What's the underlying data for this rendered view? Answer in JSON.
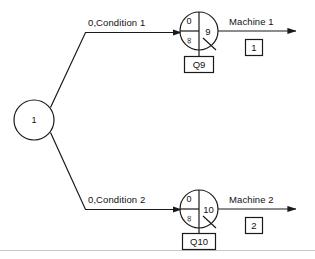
{
  "diagram": {
    "type": "queueing-network-flow-diagram",
    "source_node": {
      "label": "1",
      "name": "source-node"
    },
    "branches": [
      {
        "id": "branch-1",
        "edge_label": "0,Condition 1",
        "queue_node": {
          "top_left": "0",
          "bottom_left": "∞",
          "right": "9",
          "queue_label": "Q9"
        },
        "service_label": "Machine 1",
        "service_box": "1"
      },
      {
        "id": "branch-2",
        "edge_label": "0,Condition 2",
        "queue_node": {
          "top_left": "0",
          "bottom_left": "∞",
          "right": "10",
          "queue_label": "Q10"
        },
        "service_label": "Machine 2",
        "service_box": "2"
      }
    ],
    "colors": {
      "ink": "#1a1a1a",
      "paper": "#ffffff",
      "rule": "#c8c8c8"
    }
  }
}
